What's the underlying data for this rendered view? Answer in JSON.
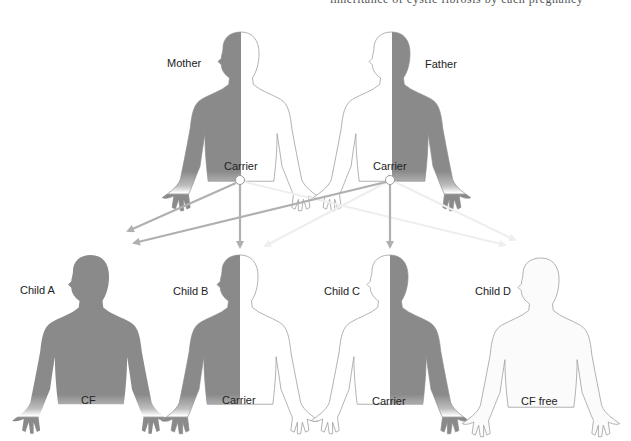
{
  "top_fragment": "inheritance of cystic fibrosis by each pregnancy",
  "colors": {
    "affected_fill": "#8a8a8a",
    "outline": "#9a9a9a",
    "arrow": "#b0b0b0",
    "arrow_faint": "#ececec"
  },
  "parents": [
    {
      "name": "Mother",
      "status": "Carrier",
      "dark_side": "left"
    },
    {
      "name": "Father",
      "status": "Carrier",
      "dark_side": "right"
    }
  ],
  "children": [
    {
      "name": "Child A",
      "status": "CF",
      "fill": "full"
    },
    {
      "name": "Child B",
      "status": "Carrier",
      "dark_side": "left"
    },
    {
      "name": "Child C",
      "status": "Carrier",
      "dark_side": "right"
    },
    {
      "name": "Child D",
      "status": "CF free",
      "fill": "none"
    }
  ]
}
